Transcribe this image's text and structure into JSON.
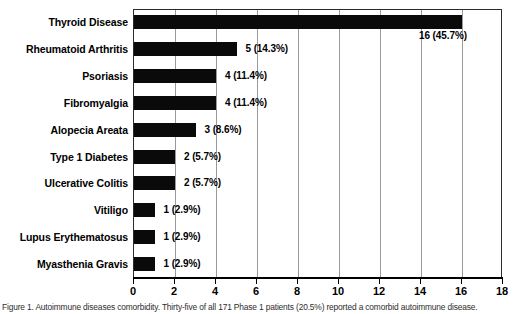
{
  "chart_data": {
    "type": "bar",
    "orientation": "horizontal",
    "title": "",
    "xlabel": "",
    "ylabel": "",
    "xlim": [
      0,
      18
    ],
    "xticks": [
      0,
      2,
      4,
      6,
      8,
      10,
      12,
      14,
      16,
      18
    ],
    "grid": true,
    "legend": null,
    "total": 35,
    "categories": [
      "Thyroid Disease",
      "Rheumatoid Arthritis",
      "Psoriasis",
      "Fibromyalgia",
      "Alopecia Areata",
      "Type 1 Diabetes",
      "Ulcerative Colitis",
      "Vitiligo",
      "Lupus Erythematosus",
      "Myasthenia Gravis"
    ],
    "values": [
      16,
      5,
      4,
      4,
      3,
      2,
      2,
      1,
      1,
      1
    ],
    "percents": [
      45.7,
      14.3,
      11.4,
      11.4,
      8.6,
      5.7,
      5.7,
      2.9,
      2.9,
      2.9
    ],
    "data_labels": [
      "16 (45.7%)",
      "5 (14.3%)",
      "4 (11.4%)",
      "4 (11.4%)",
      "3 (8.6%)",
      "2 (5.7%)",
      "2 (5.7%)",
      "1 (2.9%)",
      "1 (2.9%)",
      "1 (2.9%)"
    ],
    "bar_color": "#0a0a0a",
    "gridline_color": "#9a9a9a",
    "axis_color": "#000000"
  },
  "caption": {
    "text": "Figure 1. Autoimmune diseases comorbidity. Thirty-five of all 171 Phase 1 patients (20.5%) reported a comorbid autoimmune disease."
  }
}
